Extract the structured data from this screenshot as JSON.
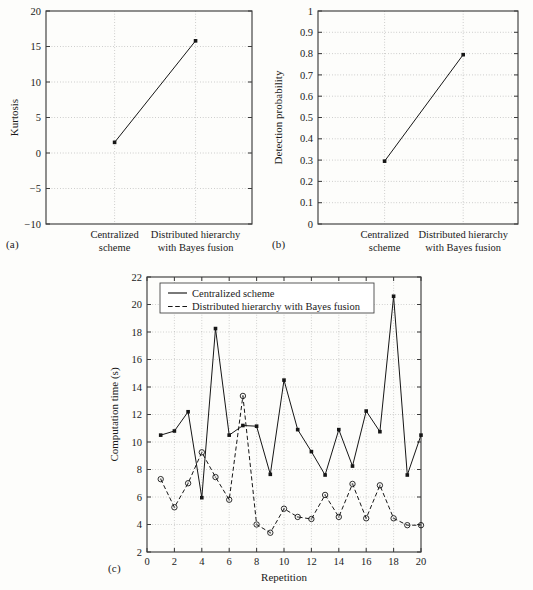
{
  "figure": {
    "panel_a_tag": "(a)",
    "panel_b_tag": "(b)",
    "panel_c_tag": "(c)"
  },
  "chart_data": [
    {
      "type": "line",
      "panel": "(a)",
      "title": "",
      "xlabel": "",
      "ylabel": "Kurtosis",
      "categories": [
        "Centralized scheme",
        "Distributed hierarchy with Bayes fusion"
      ],
      "category_lines": [
        [
          "Centralized",
          "scheme"
        ],
        [
          "Distributed hierarchy",
          "with Bayes fusion"
        ]
      ],
      "values": [
        1.5,
        15.8
      ],
      "ylim": [
        -10,
        20
      ],
      "yticks": [
        -10,
        -5,
        0,
        5,
        10,
        15,
        20
      ],
      "ytick_labels": [
        "−10",
        "−5",
        "0",
        "5",
        "10",
        "15",
        "20"
      ],
      "grid": true,
      "marker": "filled-square",
      "legend": "none"
    },
    {
      "type": "line",
      "panel": "(b)",
      "title": "",
      "xlabel": "",
      "ylabel": "Detection probability",
      "categories": [
        "Centralized scheme",
        "Distributed hierarchy with Bayes fusion"
      ],
      "category_lines": [
        [
          "Centralized",
          "scheme"
        ],
        [
          "Distributed hierarchy",
          "with Bayes fusion"
        ]
      ],
      "values": [
        0.295,
        0.795
      ],
      "ylim": [
        0,
        1
      ],
      "yticks": [
        0,
        0.1,
        0.2,
        0.3,
        0.4,
        0.5,
        0.6,
        0.7,
        0.8,
        0.9,
        1
      ],
      "ytick_labels": [
        "0",
        "0.1",
        "0.2",
        "0.3",
        "0.4",
        "0.5",
        "0.6",
        "0.7",
        "0.8",
        "0.9",
        "1"
      ],
      "grid": true,
      "marker": "filled-square",
      "legend": "none"
    },
    {
      "type": "line",
      "panel": "(c)",
      "title": "",
      "xlabel": "Repetition",
      "ylabel": "Computation time (s)",
      "x": [
        1,
        2,
        3,
        4,
        5,
        6,
        7,
        8,
        9,
        10,
        11,
        12,
        13,
        14,
        15,
        16,
        17,
        18,
        19,
        20
      ],
      "xlim": [
        0,
        20
      ],
      "xticks": [
        0,
        2,
        4,
        6,
        8,
        10,
        12,
        14,
        16,
        18,
        20
      ],
      "xtick_labels": [
        "0",
        "2",
        "4",
        "6",
        "8",
        "10",
        "12",
        "14",
        "16",
        "18",
        "20"
      ],
      "ylim": [
        2,
        22
      ],
      "yticks": [
        2,
        4,
        6,
        8,
        10,
        12,
        14,
        16,
        18,
        20,
        22
      ],
      "ytick_labels": [
        "2",
        "4",
        "6",
        "8",
        "10",
        "12",
        "14",
        "16",
        "18",
        "20",
        "22"
      ],
      "grid": true,
      "legend_position": "top-left",
      "series": [
        {
          "name": "Centralized scheme",
          "style": "solid",
          "marker": "filled-square",
          "values": [
            10.5,
            10.8,
            12.2,
            5.95,
            18.25,
            10.5,
            11.2,
            11.15,
            7.65,
            14.5,
            10.9,
            9.3,
            7.6,
            10.9,
            8.25,
            12.25,
            10.75,
            20.6,
            7.6,
            10.5
          ]
        },
        {
          "name": "Distributed hierarchy with Bayes fusion",
          "style": "dashed",
          "marker": "open-circle",
          "values": [
            7.3,
            5.25,
            7.0,
            9.25,
            7.45,
            5.8,
            13.35,
            4.0,
            3.4,
            5.15,
            4.55,
            4.4,
            6.15,
            4.55,
            6.95,
            4.45,
            6.85,
            4.45,
            3.95,
            3.95
          ]
        }
      ]
    }
  ]
}
